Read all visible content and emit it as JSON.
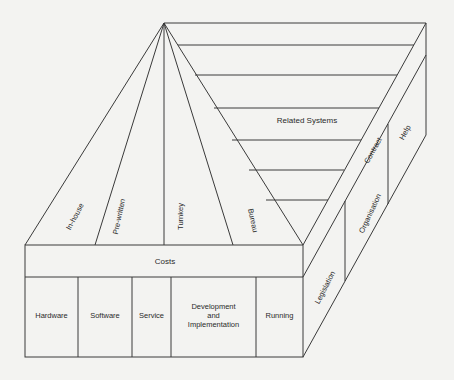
{
  "diagram": {
    "roof_options": [
      "In-house",
      "Pre-written",
      "Turnkey",
      "Bureau"
    ],
    "roof_side_label": "Related Systems",
    "costs_label": "Costs",
    "cost_columns": [
      "Hardware",
      "Software",
      "Service",
      "Development and Implementation",
      "Running"
    ],
    "cost_column_dev": {
      "line1": "Development",
      "line2": "and",
      "line3": "Implementation"
    },
    "side_labels": {
      "legislation": "Legislation",
      "contract": "Contract",
      "organisation": "Organisation",
      "help": "Help"
    }
  }
}
